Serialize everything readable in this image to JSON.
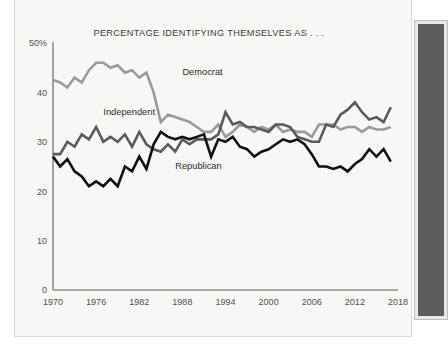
{
  "page": {
    "background_color": "#ffffff",
    "card_background": "#f7f7f6"
  },
  "side_panel": {
    "name": "right-dark-panel",
    "fill_color": "#5d5d5d",
    "frame_color": "#bdbdbd"
  },
  "chart_data": {
    "type": "line",
    "title": "PERCENTAGE IDENTIFYING THEMSELVES AS . . .",
    "xlabel": "",
    "ylabel": "",
    "xlim": [
      1970,
      2018
    ],
    "ylim": [
      0,
      50
    ],
    "grid": false,
    "legend": "inline-annotations",
    "y_ticks": [
      0,
      10,
      20,
      30,
      40,
      50
    ],
    "y_tick_labels": [
      "0",
      "10",
      "20",
      "30",
      "40",
      "50%"
    ],
    "x_ticks": [
      1970,
      1976,
      1982,
      1988,
      1994,
      2000,
      2006,
      2012,
      2018
    ],
    "x_tick_labels": [
      "1970",
      "1976",
      "1982",
      "1988",
      "1994",
      "2000",
      "2006",
      "2012",
      "2018"
    ],
    "x": [
      1970,
      1971,
      1972,
      1973,
      1974,
      1975,
      1976,
      1977,
      1978,
      1979,
      1980,
      1981,
      1982,
      1983,
      1984,
      1985,
      1986,
      1987,
      1988,
      1989,
      1990,
      1991,
      1992,
      1993,
      1994,
      1995,
      1996,
      1997,
      1998,
      1999,
      2000,
      2001,
      2002,
      2003,
      2004,
      2005,
      2006,
      2007,
      2008,
      2009,
      2010,
      2011,
      2012,
      2013,
      2014,
      2015,
      2016,
      2017
    ],
    "series": [
      {
        "name": "Democrat",
        "color": "#9a9a9a",
        "label_x": 1988,
        "label_y": 43.5,
        "values": [
          42.5,
          42.0,
          41.0,
          43.0,
          42.0,
          44.5,
          46.0,
          46.0,
          45.0,
          45.5,
          44.0,
          44.5,
          43.0,
          44.0,
          40.0,
          34.0,
          35.5,
          35.0,
          34.5,
          34.0,
          33.0,
          32.0,
          32.0,
          33.5,
          31.0,
          32.0,
          33.5,
          33.0,
          32.0,
          33.0,
          32.5,
          33.5,
          32.0,
          32.5,
          32.0,
          32.0,
          31.0,
          33.5,
          33.5,
          33.5,
          32.5,
          33.0,
          33.0,
          32.0,
          33.0,
          32.5,
          32.5,
          33.0
        ]
      },
      {
        "name": "Independent",
        "color": "#5a5a5a",
        "label_x": 1977,
        "label_y": 35.5,
        "values": [
          27.5,
          27.5,
          30.0,
          29.0,
          31.5,
          30.5,
          33.0,
          30.0,
          31.0,
          30.0,
          31.5,
          29.0,
          32.0,
          29.5,
          28.5,
          28.0,
          29.5,
          28.0,
          30.5,
          29.5,
          30.5,
          30.5,
          30.5,
          31.5,
          36.0,
          33.5,
          34.0,
          33.0,
          33.0,
          32.5,
          32.0,
          33.5,
          33.5,
          33.0,
          31.0,
          30.5,
          30.0,
          30.0,
          33.5,
          33.0,
          35.5,
          36.5,
          38.0,
          36.0,
          34.5,
          35.0,
          34.0,
          37.0
        ]
      },
      {
        "name": "Republican",
        "color": "#111111",
        "label_x": 1987,
        "label_y": 24.5,
        "values": [
          27.0,
          25.0,
          26.5,
          24.0,
          23.0,
          21.0,
          22.0,
          21.0,
          22.5,
          21.0,
          25.0,
          24.0,
          27.0,
          24.5,
          29.5,
          32.0,
          31.0,
          30.5,
          31.0,
          30.5,
          31.0,
          31.5,
          27.0,
          30.5,
          30.0,
          31.0,
          29.0,
          28.5,
          27.0,
          28.0,
          28.5,
          29.5,
          30.5,
          30.0,
          30.5,
          29.5,
          27.5,
          25.0,
          25.0,
          24.5,
          25.0,
          24.0,
          25.5,
          26.5,
          28.5,
          27.0,
          28.5,
          26.0
        ]
      }
    ]
  }
}
